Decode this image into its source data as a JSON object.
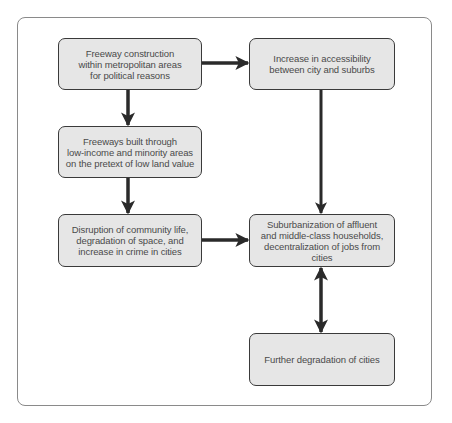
{
  "diagram": {
    "type": "flowchart",
    "nodes": [
      {
        "id": "n1",
        "label": "Freeway construction\nwithin metropolitan areas\nfor political reasons"
      },
      {
        "id": "n2",
        "label": "Increase in accessibility\nbetween city and suburbs"
      },
      {
        "id": "n3",
        "label": "Freeways built through\nlow-income and minority areas\non the pretext of low land value"
      },
      {
        "id": "n4",
        "label": "Disruption of community life,\ndegradation of space, and\nincrease in crime in cities"
      },
      {
        "id": "n5",
        "label": "Suburbanization of affluent\nand middle-class households,\ndecentralization of jobs from cities"
      },
      {
        "id": "n6",
        "label": "Further degradation of cities"
      }
    ],
    "edges": [
      {
        "from": "n1",
        "to": "n2",
        "direction": "forward"
      },
      {
        "from": "n1",
        "to": "n3",
        "direction": "forward"
      },
      {
        "from": "n3",
        "to": "n4",
        "direction": "forward"
      },
      {
        "from": "n2",
        "to": "n5",
        "direction": "forward"
      },
      {
        "from": "n4",
        "to": "n5",
        "direction": "forward"
      },
      {
        "from": "n5",
        "to": "n6",
        "direction": "both"
      }
    ],
    "colors": {
      "node_fill": "#e6e6e6",
      "node_border": "#3a3a3a",
      "text": "#4a4a4a",
      "arrow": "#2a2a2a",
      "frame": "#8a8a8a"
    }
  }
}
